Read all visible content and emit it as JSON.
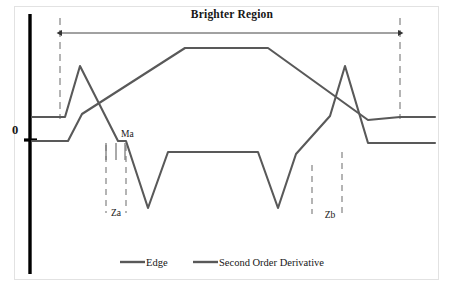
{
  "figure": {
    "title": "Brighter Region",
    "axis_origin_label": "0",
    "background_color": "#ffffff",
    "frame_color": "#e2e2e2",
    "axis_color": "#000000",
    "curve_color": "#595959",
    "dash_color": "#808080",
    "arrow_color": "#444444"
  },
  "annotations": {
    "ma": "Ma",
    "za": "Za",
    "zb": "Zb"
  },
  "legend": {
    "position": "bottom-center",
    "items": [
      {
        "label": "Edge",
        "color": "#595959"
      },
      {
        "label": "Second Order Derivative",
        "color": "#595959"
      }
    ]
  },
  "chart_data": {
    "type": "line",
    "title": "Brighter Region",
    "xlabel": "",
    "ylabel": "",
    "grid": false,
    "legend_position": "bottom-center",
    "xlim": [
      0,
      455
    ],
    "ylim": [
      0,
      297
    ],
    "axis_zero_y": 140,
    "annotations": {
      "brighter_region_span": [
        60,
        400
      ],
      "arrow_y": 33,
      "ma_x": 118,
      "za_span": [
        105,
        126
      ],
      "zb_span": [
        312,
        342
      ],
      "vertical_dash_left_x": 60,
      "vertical_dash_right_x": 400,
      "thick_axis_x": 30
    },
    "series": [
      {
        "name": "Edge",
        "color": "#595959",
        "points": [
          [
            32,
            117
          ],
          [
            57,
            117
          ],
          [
            65,
            117
          ],
          [
            80,
            66
          ],
          [
            118,
            141
          ],
          [
            126,
            141
          ],
          [
            148,
            208
          ],
          [
            168,
            152
          ],
          [
            185,
            152
          ],
          [
            258,
            152
          ],
          [
            278,
            208
          ],
          [
            296,
            154
          ],
          [
            330,
            116
          ],
          [
            345,
            66
          ],
          [
            368,
            143
          ],
          [
            400,
            143
          ],
          [
            435,
            143
          ]
        ]
      },
      {
        "name": "Second Order Derivative",
        "color": "#595959",
        "points": [
          [
            32,
            141
          ],
          [
            68,
            141
          ],
          [
            82,
            114
          ],
          [
            185,
            48
          ],
          [
            268,
            48
          ],
          [
            368,
            120
          ],
          [
            400,
            117
          ],
          [
            435,
            117
          ]
        ]
      }
    ]
  }
}
